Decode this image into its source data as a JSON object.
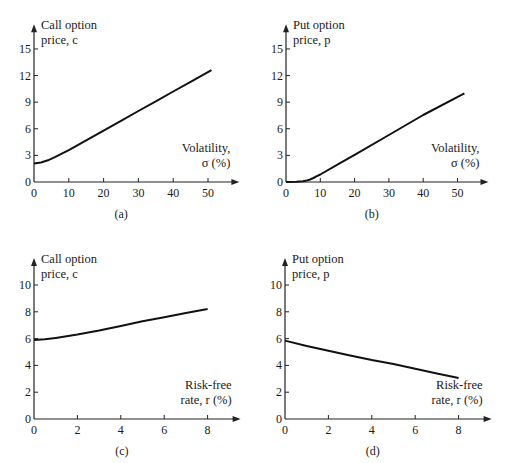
{
  "chart_data": [
    {
      "id": "a",
      "type": "line",
      "caption": "(a)",
      "ylabel": [
        "Call option",
        "price, c"
      ],
      "xlabel": [
        "Volatility,",
        "σ (%)"
      ],
      "xticks": [
        0,
        10,
        20,
        30,
        40,
        50
      ],
      "yticks": [
        0,
        3,
        6,
        9,
        12,
        15
      ],
      "xlim": [
        0,
        57
      ],
      "ylim": [
        0,
        17
      ],
      "grid": false,
      "x": [
        0,
        2,
        4,
        6,
        8,
        10,
        15,
        20,
        25,
        30,
        35,
        40,
        45,
        51
      ],
      "values": [
        2.1,
        2.2,
        2.45,
        2.8,
        3.2,
        3.6,
        4.7,
        5.8,
        6.9,
        8.0,
        9.1,
        10.2,
        11.3,
        12.6
      ],
      "plot": {
        "x0": 34,
        "y0": 182,
        "xscale": 3.48,
        "yscale": 8.87
      }
    },
    {
      "id": "b",
      "type": "line",
      "caption": "(b)",
      "ylabel": [
        "Put option",
        "price, p"
      ],
      "xlabel": [
        "Volatility,",
        "σ (%)"
      ],
      "xticks": [
        0,
        10,
        20,
        30,
        40,
        50
      ],
      "yticks": [
        0,
        3,
        6,
        9,
        12,
        15
      ],
      "xlim": [
        0,
        57
      ],
      "ylim": [
        0,
        17
      ],
      "grid": false,
      "x": [
        0,
        3,
        5,
        6,
        7,
        8,
        9,
        10,
        15,
        20,
        30,
        40,
        52
      ],
      "values": [
        0,
        0.02,
        0.08,
        0.16,
        0.28,
        0.45,
        0.65,
        0.85,
        1.95,
        3.05,
        5.3,
        7.55,
        10.0
      ],
      "plot": {
        "x0": 286,
        "y0": 182,
        "xscale": 3.43,
        "yscale": 8.87
      }
    },
    {
      "id": "c",
      "type": "line",
      "caption": "(c)",
      "ylabel": [
        "Call option",
        "price, c"
      ],
      "xlabel": [
        "Risk-free",
        "rate, r (%)"
      ],
      "xticks": [
        0,
        2,
        4,
        6,
        8
      ],
      "yticks": [
        0,
        2,
        4,
        6,
        8,
        10
      ],
      "xlim": [
        0,
        9.2
      ],
      "ylim": [
        0,
        11.5
      ],
      "grid": false,
      "x": [
        0,
        0.5,
        1,
        2,
        3,
        4,
        5,
        6,
        7,
        8
      ],
      "values": [
        5.9,
        5.95,
        6.05,
        6.3,
        6.6,
        6.95,
        7.3,
        7.6,
        7.9,
        8.2
      ],
      "plot": {
        "x0": 34,
        "y0": 419,
        "xscale": 21.7,
        "yscale": 13.4
      }
    },
    {
      "id": "d",
      "type": "line",
      "caption": "(d)",
      "ylabel": [
        "Put option",
        "price, p"
      ],
      "xlabel": [
        "Risk-free",
        "rate, r (%)"
      ],
      "xticks": [
        0,
        2,
        4,
        6,
        8
      ],
      "yticks": [
        0,
        2,
        4,
        6,
        8,
        10
      ],
      "xlim": [
        0,
        9.2
      ],
      "ylim": [
        0,
        11.5
      ],
      "grid": false,
      "x": [
        0,
        1,
        2,
        3,
        4,
        5,
        6,
        7,
        8
      ],
      "values": [
        5.85,
        5.45,
        5.1,
        4.75,
        4.4,
        4.1,
        3.75,
        3.4,
        3.05
      ],
      "plot": {
        "x0": 285,
        "y0": 419,
        "xscale": 21.7,
        "yscale": 13.4
      }
    }
  ],
  "footer": {
    "faint_caption": "Figure — effect of volatility and risk-free rate on option prices"
  }
}
